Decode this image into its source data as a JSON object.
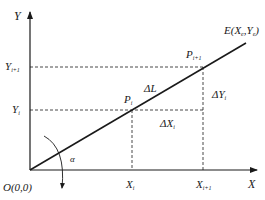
{
  "diagram": {
    "axes": {
      "x_label": "X",
      "y_label": "Y",
      "origin_label": "O(0,0)"
    },
    "line": {
      "endpoint_label": "E(X",
      "endpoint_sub_e": "e",
      "endpoint_mid": ",Y",
      "endpoint_sub_e2": "e",
      "endpoint_close": ")"
    },
    "points": {
      "p_i": {
        "base": "P",
        "sub": "i"
      },
      "p_i1": {
        "base": "P",
        "sub": "i+1"
      }
    },
    "ticks": {
      "x_i": {
        "base": "X",
        "sub": "i"
      },
      "x_i1": {
        "base": "X",
        "sub": "i+1"
      },
      "y_i": {
        "base": "Y",
        "sub": "i"
      },
      "y_i1": {
        "base": "Y",
        "sub": "i+1"
      }
    },
    "increments": {
      "delta_l": "ΔL",
      "delta_x": {
        "base": "ΔX",
        "sub": "i"
      },
      "delta_y": {
        "base": "ΔY",
        "sub": "i"
      }
    },
    "angle_label": "α",
    "colors": {
      "stroke": "#1a1a1a",
      "background": "#ffffff"
    }
  }
}
